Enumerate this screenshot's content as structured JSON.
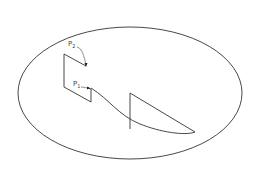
{
  "diagram": {
    "labels": {
      "p2": {
        "main": "P",
        "sub": "2"
      },
      "p1": {
        "main": "P",
        "sub": "1"
      }
    },
    "colors": {
      "stroke": "#333333",
      "background": "#ffffff"
    }
  }
}
